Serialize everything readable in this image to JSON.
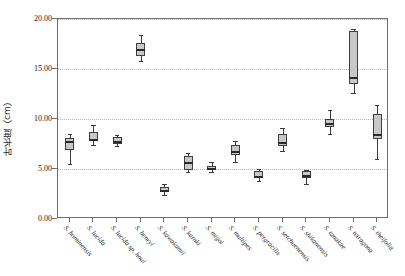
{
  "chart_data": {
    "type": "box",
    "title": "",
    "xlabel": "",
    "ylabel": "叶长度（cm）",
    "ylim": [
      0.0,
      20.0
    ],
    "ytick_labels": [
      "0.00",
      "5.00",
      "10.00",
      "15.00",
      "20.00"
    ],
    "ytick_values": [
      0,
      5,
      10,
      15,
      20
    ],
    "grid": "horizontal dotted gridlines at 5.00, 10.00, 15.00, 20.00",
    "legend": "none",
    "categories": [
      "S. hominensis",
      "S. lucida",
      "S. lucida sp. houi",
      "S. henryi",
      "S. kawakamii",
      "S. kuroki",
      "S. migoi",
      "S. multipes",
      "S. pergracilis",
      "S. setchuenensis",
      "S. shikanensis",
      "S. tanakae",
      "S. tetragona",
      "S. theifolia"
    ],
    "boxes": [
      {
        "name": "S. hominensis",
        "whisker_low": 5.5,
        "q1": 6.9,
        "median": 7.8,
        "q3": 8.1,
        "whisker_high": 8.5
      },
      {
        "name": "S. lucida",
        "whisker_low": 7.4,
        "q1": 7.8,
        "median": 8.0,
        "q3": 8.7,
        "whisker_high": 9.4
      },
      {
        "name": "S. lucida sp. houi",
        "whisker_low": 7.3,
        "q1": 7.5,
        "median": 7.8,
        "q3": 8.2,
        "whisker_high": 8.4
      },
      {
        "name": "S. henryi",
        "whisker_low": 15.8,
        "q1": 16.3,
        "median": 17.0,
        "q3": 17.6,
        "whisker_high": 18.4
      },
      {
        "name": "S. kawakamii",
        "whisker_low": 2.4,
        "q1": 2.7,
        "median": 2.9,
        "q3": 3.2,
        "whisker_high": 3.5
      },
      {
        "name": "S. kuroki",
        "whisker_low": 4.7,
        "q1": 4.9,
        "median": 5.7,
        "q3": 6.3,
        "whisker_high": 6.6
      },
      {
        "name": "S. migoi",
        "whisker_low": 4.7,
        "q1": 4.9,
        "median": 5.1,
        "q3": 5.3,
        "whisker_high": 5.7
      },
      {
        "name": "S. multipes",
        "whisker_low": 5.7,
        "q1": 6.4,
        "median": 6.8,
        "q3": 7.4,
        "whisker_high": 7.8
      },
      {
        "name": "S. pergracilis",
        "whisker_low": 3.8,
        "q1": 4.1,
        "median": 4.3,
        "q3": 4.8,
        "whisker_high": 5.0
      },
      {
        "name": "S. setchuenensis",
        "whisker_low": 6.8,
        "q1": 7.3,
        "median": 7.7,
        "q3": 8.5,
        "whisker_high": 9.1
      },
      {
        "name": "S. shikanensis",
        "whisker_low": 3.5,
        "q1": 4.1,
        "median": 4.4,
        "q3": 4.8,
        "whisker_high": 4.9
      },
      {
        "name": "S. tanakae",
        "whisker_low": 8.5,
        "q1": 9.2,
        "median": 9.6,
        "q3": 10.0,
        "whisker_high": 10.9
      },
      {
        "name": "S. tetragona",
        "whisker_low": 12.6,
        "q1": 13.5,
        "median": 14.2,
        "q3": 18.8,
        "whisker_high": 19.0
      },
      {
        "name": "S. theifolia",
        "whisker_low": 6.0,
        "q1": 8.0,
        "median": 8.5,
        "q3": 10.5,
        "whisker_high": 11.4
      }
    ]
  }
}
